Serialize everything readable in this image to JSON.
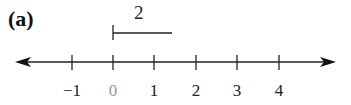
{
  "panel_label": "(a)",
  "bracket": {
    "label": "2",
    "start_value": 0,
    "end_value": 1.45
  },
  "axis": {
    "ticks": [
      {
        "value": -1,
        "label": "−1",
        "x": 72,
        "highlight": false
      },
      {
        "value": 0,
        "label": "0",
        "x": 113,
        "highlight": true
      },
      {
        "value": 1,
        "label": "1",
        "x": 154,
        "highlight": false
      },
      {
        "value": 2,
        "label": "2",
        "x": 196,
        "highlight": false
      },
      {
        "value": 3,
        "label": "3",
        "x": 237,
        "highlight": false
      },
      {
        "value": 4,
        "label": "4",
        "x": 279,
        "highlight": false
      }
    ],
    "arrows": "both",
    "line_color": "#222222",
    "highlight_color": "#999999"
  }
}
